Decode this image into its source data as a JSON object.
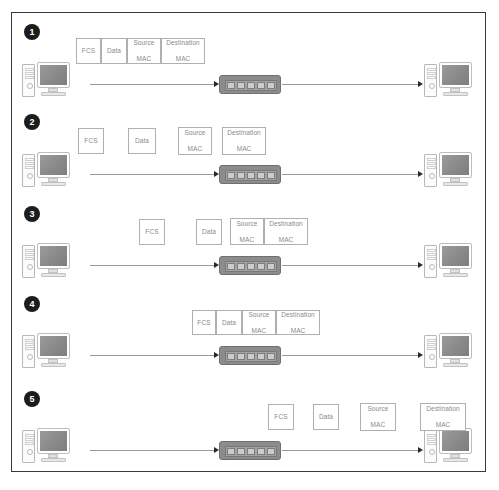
{
  "diagram": {
    "title": "Ethernet Frame Transmission Through a Switch",
    "border_color": "#3a3a3a",
    "background": "#ffffff",
    "wire_color": "#9a9a9a",
    "box_border_color": "#b0b0b0",
    "box_text_color": "#8a8a8a",
    "badge_color": "#1c1c1c",
    "switch_color": "#8c8c8c"
  },
  "field_labels": {
    "fcs": "FCS",
    "data": "Data",
    "source_mac_line1": "Source",
    "source_mac_line2": "MAC",
    "destination_mac_line1": "Destination",
    "destination_mac_line2": "MAC"
  },
  "icons": {
    "source_computer": "desktop-computer-icon",
    "destination_computer": "desktop-computer-icon",
    "network_switch": "network-switch-icon",
    "arrow": "arrow-right-icon"
  },
  "steps": [
    {
      "number": "1",
      "badge_label": "1",
      "boxes": [
        {
          "label": "FCS",
          "line2": "",
          "x": 76,
          "y": 38,
          "w": 25,
          "h": 26
        },
        {
          "label": "Data",
          "line2": "",
          "x": 101,
          "y": 38,
          "w": 26,
          "h": 26
        },
        {
          "label": "Source",
          "line2": "MAC",
          "x": 127,
          "y": 38,
          "w": 34,
          "h": 26
        },
        {
          "label": "Destination",
          "line2": "MAC",
          "x": 161,
          "y": 38,
          "w": 44,
          "h": 26
        }
      ]
    },
    {
      "number": "2",
      "badge_label": "2",
      "boxes": [
        {
          "label": "FCS",
          "line2": "",
          "x": 78,
          "y": 128,
          "w": 26,
          "h": 26
        },
        {
          "label": "Data",
          "line2": "",
          "x": 128,
          "y": 128,
          "w": 28,
          "h": 26
        },
        {
          "label": "Source",
          "line2": "MAC",
          "x": 178,
          "y": 128,
          "w": 34,
          "h": 28
        },
        {
          "label": "Destination",
          "line2": "MAC",
          "x": 222,
          "y": 128,
          "w": 44,
          "h": 28
        }
      ]
    },
    {
      "number": "3",
      "badge_label": "3",
      "boxes": [
        {
          "label": "FCS",
          "line2": "",
          "x": 139,
          "y": 219,
          "w": 26,
          "h": 26
        },
        {
          "label": "Data",
          "line2": "",
          "x": 196,
          "y": 219,
          "w": 26,
          "h": 26
        },
        {
          "label": "Source",
          "line2": "MAC",
          "x": 230,
          "y": 219,
          "w": 34,
          "h": 27
        },
        {
          "label": "Destination",
          "line2": "MAC",
          "x": 264,
          "y": 219,
          "w": 44,
          "h": 27
        }
      ]
    },
    {
      "number": "4",
      "badge_label": "4",
      "boxes": [
        {
          "label": "FCS",
          "line2": "",
          "x": 192,
          "y": 310,
          "w": 24,
          "h": 25
        },
        {
          "label": "Data",
          "line2": "",
          "x": 216,
          "y": 310,
          "w": 26,
          "h": 25
        },
        {
          "label": "Source",
          "line2": "MAC",
          "x": 242,
          "y": 310,
          "w": 34,
          "h": 25
        },
        {
          "label": "Destination",
          "line2": "MAC",
          "x": 276,
          "y": 310,
          "w": 44,
          "h": 25
        }
      ]
    },
    {
      "number": "5",
      "badge_label": "5",
      "boxes": [
        {
          "label": "FCS",
          "line2": "",
          "x": 268,
          "y": 404,
          "w": 26,
          "h": 26
        },
        {
          "label": "Data",
          "line2": "",
          "x": 313,
          "y": 404,
          "w": 26,
          "h": 26
        },
        {
          "label": "Source",
          "line2": "MAC",
          "x": 360,
          "y": 404,
          "w": 36,
          "h": 28
        },
        {
          "label": "Destination",
          "line2": "MAC",
          "x": 420,
          "y": 404,
          "w": 46,
          "h": 28
        }
      ]
    }
  ]
}
